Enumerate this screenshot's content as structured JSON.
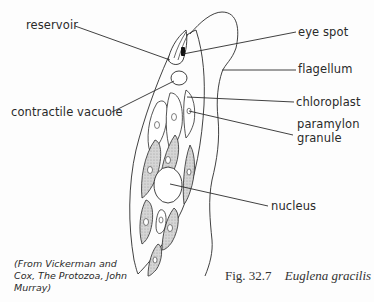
{
  "figure": {
    "number": "Fig. 32.7",
    "species": "Euglena gracilis",
    "credit": "(From Vickerman and Cox, The Protozoa, John Murray)"
  },
  "labels": {
    "reservoir": "reservoir",
    "contractile_vacuole": "contractile vacuole",
    "eye_spot": "eye spot",
    "flagellum": "flagellum",
    "chloroplast": "chloroplast",
    "paramylon_line1": "paramylon",
    "paramylon_line2": "granule",
    "nucleus": "nucleus"
  },
  "colors": {
    "line": "#2b2b2b",
    "chloroplast_fill": "#c9c9c9",
    "eye_spot": "#111111",
    "background": "#fdfdfd"
  }
}
